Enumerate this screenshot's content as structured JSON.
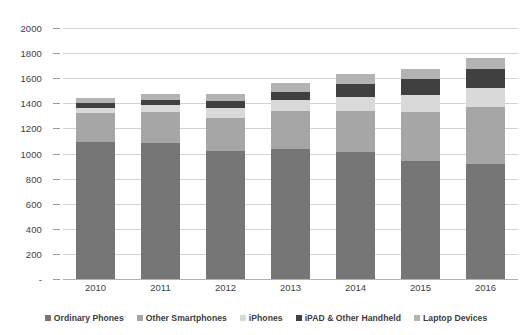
{
  "chart_data": {
    "type": "bar",
    "stacked": true,
    "title": "",
    "xlabel": "",
    "ylabel": "",
    "categories": [
      "2010",
      "2011",
      "2012",
      "2013",
      "2014",
      "2015",
      "2016"
    ],
    "ylim": [
      0,
      2000
    ],
    "yticks": [
      0,
      200,
      400,
      600,
      800,
      1000,
      1200,
      1400,
      1600,
      1800,
      2000
    ],
    "ytick_labels": [
      "-",
      "200",
      "400",
      "600",
      "800",
      "1000",
      "1200",
      "1400",
      "1600",
      "1800",
      "2000"
    ],
    "grid": true,
    "legend_position": "bottom",
    "series": [
      {
        "name": "Ordinary Phones",
        "color": "#767676",
        "values": [
          1090,
          1080,
          1020,
          1035,
          1010,
          940,
          920
        ]
      },
      {
        "name": "Other Smartphones",
        "color": "#a6a6a6",
        "values": [
          230,
          250,
          265,
          300,
          330,
          390,
          450
        ]
      },
      {
        "name": "iPhones",
        "color": "#d9d9d9",
        "values": [
          45,
          55,
          80,
          90,
          110,
          135,
          155
        ]
      },
      {
        "name": "iPAD & Other Handheld",
        "color": "#404040",
        "values": [
          35,
          45,
          55,
          65,
          105,
          125,
          145
        ]
      },
      {
        "name": "Laptop Devices",
        "color": "#b3b3b3",
        "values": [
          45,
          45,
          55,
          75,
          80,
          85,
          95
        ]
      }
    ],
    "totals": [
      1445,
      1475,
      1475,
      1565,
      1635,
      1675,
      1765
    ]
  },
  "legend": {
    "items": [
      {
        "label": "Ordinary Phones",
        "color": "#767676"
      },
      {
        "label": "Other Smartphones",
        "color": "#a6a6a6"
      },
      {
        "label": "iPhones",
        "color": "#d9d9d9"
      },
      {
        "label": "iPAD & Other Handheld",
        "color": "#404040"
      },
      {
        "label": "Laptop Devices",
        "color": "#b3b3b3"
      }
    ]
  }
}
